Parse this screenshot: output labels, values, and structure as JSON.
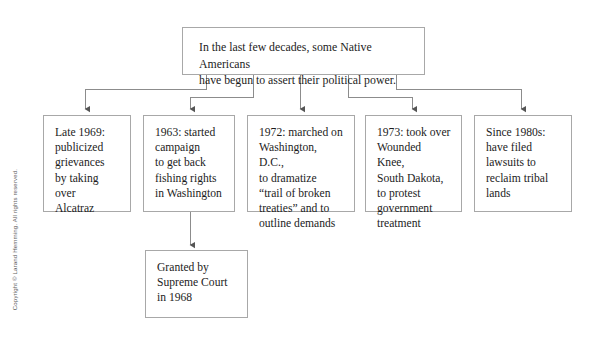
{
  "diagram": {
    "type": "flowchart",
    "title_box": {
      "id": "root",
      "text": "In the last few decades, some Native Americans\nhave begun to assert their political power."
    },
    "branches": [
      {
        "id": "branch-1",
        "text": "Late 1969:\npublicized\ngrievances\nby taking over\nAlcatraz"
      },
      {
        "id": "branch-2",
        "text": "1963: started\ncampaign\nto get back\nfishing rights\nin Washington"
      },
      {
        "id": "branch-3",
        "text": "1972: marched on\nWashington, D.C.,\nto dramatize\n“trail of broken\ntreaties” and to\noutline demands"
      },
      {
        "id": "branch-4",
        "text": "1973: took over\nWounded Knee,\nSouth Dakota,\nto protest\ngovernment\ntreatment"
      },
      {
        "id": "branch-5",
        "text": "Since 1980s:\nhave filed\nlawsuits to\nreclaim tribal\nlands"
      }
    ],
    "sub_boxes": [
      {
        "id": "sub-1",
        "parent": "branch-2",
        "text": "Granted by\nSupreme Court\nin 1968"
      }
    ],
    "colors": {
      "background": "#ffffff",
      "box_border": "#a8a8a8",
      "connector": "#8c8c8c",
      "text": "#1c1c1c",
      "copyright_text": "#5e5e5e"
    }
  },
  "copyright": {
    "text": "Copyright © Larand Hemming. All rights reserved."
  }
}
